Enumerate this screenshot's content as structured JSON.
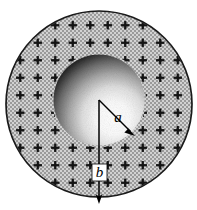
{
  "figure": {
    "background_color": "#ffffff",
    "outer_sphere": {
      "name": "charged-shell",
      "center_x": 99,
      "center_y": 104,
      "radius": 94,
      "fill_color": "#b9b9b9",
      "stroke_color": "#1a1a1a",
      "stroke_width": 1.6,
      "fill_pattern": "stipple-checker",
      "charge_symbol": "+",
      "charge_color": "#111111",
      "charge_grid_spacing": 17.5,
      "charge_arm_length": 4.2,
      "charge_arm_thickness": 2.2
    },
    "inner_sphere": {
      "name": "inner-sphere",
      "center_x": 99,
      "center_y": 100,
      "radius": 45,
      "shading": "radial-gradient",
      "highlight_x": 118,
      "highlight_y": 120,
      "highlight_color": "#ffffff",
      "shadow_color": "#000000",
      "light_direction": "lower-right"
    },
    "radius_a": {
      "name": "radius-a",
      "label": "a",
      "from_x": 99,
      "from_y": 100,
      "to_x": 133,
      "to_y": 134,
      "label_x": 118,
      "label_y": 118,
      "line_color": "#000000",
      "line_width": 1.3,
      "arrowhead": true
    },
    "radius_b": {
      "name": "radius-b",
      "label": "b",
      "from_x": 99,
      "from_y": 100,
      "to_x": 99,
      "to_y": 203,
      "label_x": 99,
      "label_y": 174,
      "line_color": "#000000",
      "line_width": 1.3,
      "arrowhead": true,
      "label_box_fill": "#ffffff"
    }
  }
}
